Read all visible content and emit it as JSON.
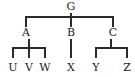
{
  "diagram": {
    "type": "tree",
    "title": "",
    "background_color": "#ffffff",
    "edge_color": "#2b2b2b",
    "text_color": "#1c1c1c",
    "edge_width": 1.4,
    "root": {
      "id": "G",
      "label": "G",
      "x": 71,
      "y": 7
    },
    "internal_nodes": [
      {
        "id": "A",
        "label": "A",
        "x": 26,
        "y": 33,
        "parent": "G",
        "child_ids": [
          "U",
          "V",
          "W"
        ]
      },
      {
        "id": "B",
        "label": "B",
        "x": 71,
        "y": 33,
        "parent": "G",
        "child_ids": [
          "X"
        ]
      },
      {
        "id": "C",
        "label": "C",
        "x": 113,
        "y": 33,
        "parent": "G",
        "child_ids": [
          "Y",
          "Z"
        ]
      }
    ],
    "leaf_nodes": [
      {
        "id": "U",
        "label": "U",
        "x": 13,
        "y": 68,
        "parent": "A"
      },
      {
        "id": "V",
        "label": "V",
        "x": 29,
        "y": 68,
        "parent": "A"
      },
      {
        "id": "W",
        "label": "W",
        "x": 45,
        "y": 68,
        "parent": "A"
      },
      {
        "id": "X",
        "label": "X",
        "x": 71,
        "y": 68,
        "parent": "B"
      },
      {
        "id": "Y",
        "label": "Y",
        "x": 96,
        "y": 68,
        "parent": "C"
      },
      {
        "id": "Z",
        "label": "Z",
        "x": 127,
        "y": 68,
        "parent": "C"
      }
    ],
    "levels": {
      "root_label_baseline_y": 12,
      "top_bar_y": 17,
      "top_bar_x_start": 26,
      "top_bar_x_end": 113,
      "mid_label_baseline_y": 38,
      "lower_bar_y": 48,
      "leaf_label_baseline_y": 73
    },
    "edges": [
      {
        "from": "G",
        "to": "A"
      },
      {
        "from": "G",
        "to": "B"
      },
      {
        "from": "G",
        "to": "C"
      },
      {
        "from": "A",
        "to": "U"
      },
      {
        "from": "A",
        "to": "V"
      },
      {
        "from": "A",
        "to": "W"
      },
      {
        "from": "B",
        "to": "X"
      },
      {
        "from": "C",
        "to": "Y"
      },
      {
        "from": "C",
        "to": "Z"
      }
    ]
  }
}
